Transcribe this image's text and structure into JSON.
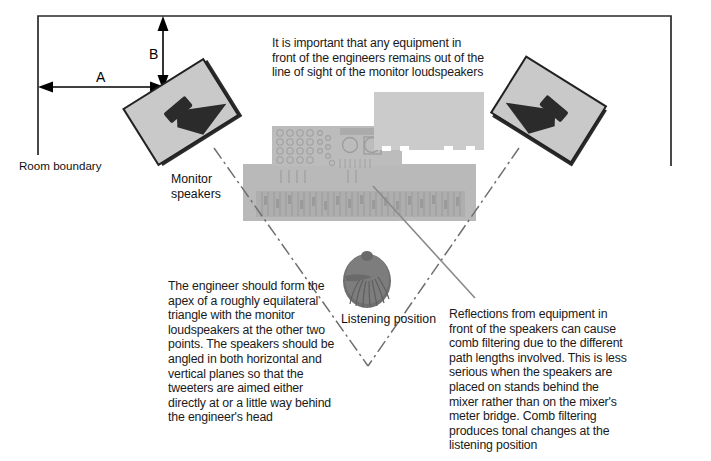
{
  "diagram": {
    "colors": {
      "ink": "#1a1a1a",
      "line": "#000000",
      "speaker_face": "#c9c9c9",
      "speaker_dark": "#2b2b2b",
      "console_body": "#b9b9b9",
      "console_detail": "#a8a8a8",
      "rack_body": "#cccccc",
      "head": "#7c7c7c",
      "sightline": "#8a8a8a"
    },
    "annotations": {
      "top_note": "It is important that any equipment in front of the engineers remains out of the line of sight of the monitor loudspeakers",
      "left_note": "The engineer should form the apex of a roughly equilateral triangle with the monitor loudspeakers at the other two points. The speakers should be angled in both horizontal and vertical planes so that the tweeters are aimed either directly at or a little way behind the engineer's head",
      "right_note": "Reflections from equipment in front of the speakers can cause comb filtering due to the different path lengths involved. This is less serious when the speakers are placed on stands behind the mixer rather than on the mixer's meter bridge. Comb filtering produces tonal changes at the listening position"
    },
    "labels": {
      "room_boundary": "Room boundary",
      "monitor_speakers": "Monitor\nspeakers",
      "listening_position": "Listening position"
    },
    "dimensions": {
      "a_label": "A",
      "b_label": "B"
    }
  }
}
